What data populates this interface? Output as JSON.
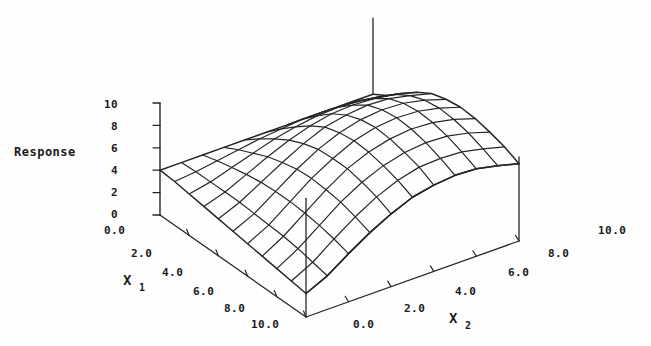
{
  "figure": {
    "kind": "3d-response-surface-wireframe",
    "background_color": "#fefefe",
    "line_color": "#262626",
    "text_color": "#1a1a1a"
  },
  "axes": {
    "z": {
      "title": "Response",
      "ticks": [
        "10",
        "8",
        "6",
        "4",
        "2",
        "0"
      ],
      "min": 0,
      "max": 10
    },
    "x1": {
      "name": "X",
      "subscript": "1",
      "ticks": [
        "0.0",
        "2.0",
        "4.0",
        "6.0",
        "8.0",
        "10.0"
      ],
      "min": 0,
      "max": 10,
      "arrow": "down-right"
    },
    "x2": {
      "name": "X",
      "subscript": "2",
      "ticks": [
        "0.0",
        "2.0",
        "4.0",
        "6.0",
        "8.0",
        "10.0"
      ],
      "min": 0,
      "max": 10,
      "arrow": "up-right"
    }
  },
  "chart_data": {
    "type": "surface",
    "title": "",
    "xlabel": "X1",
    "ylabel": "X2",
    "zlabel": "Response",
    "xlim": [
      0,
      10
    ],
    "ylim": [
      0,
      10
    ],
    "zlim": [
      0,
      10
    ],
    "grid": false,
    "legend": "none",
    "x1_values": [
      0,
      1,
      2,
      3,
      4,
      5,
      6,
      7,
      8,
      9,
      10
    ],
    "x2_values": [
      0,
      1,
      2,
      3,
      4,
      5,
      6,
      7,
      8,
      9,
      10
    ],
    "z_matrix": [
      [
        4.0,
        4.0,
        4.0,
        4.0,
        4.0,
        4.0,
        4.0,
        4.0,
        4.0,
        4.0,
        4.0
      ],
      [
        3.9,
        4.1,
        4.4,
        4.7,
        5.0,
        5.2,
        5.4,
        5.4,
        5.3,
        5.1,
        4.8
      ],
      [
        3.7,
        4.1,
        4.7,
        5.3,
        5.9,
        6.3,
        6.6,
        6.7,
        6.6,
        6.3,
        5.9
      ],
      [
        3.5,
        4.1,
        5.0,
        5.9,
        6.7,
        7.3,
        7.7,
        7.8,
        7.7,
        7.4,
        6.9
      ],
      [
        3.3,
        4.1,
        5.2,
        6.3,
        7.3,
        8.1,
        8.5,
        8.7,
        8.6,
        8.2,
        7.7
      ],
      [
        3.1,
        4.0,
        5.3,
        6.6,
        7.7,
        8.5,
        9.0,
        9.2,
        9.1,
        8.7,
        8.1
      ],
      [
        2.9,
        3.9,
        5.3,
        6.7,
        7.8,
        8.7,
        9.2,
        9.4,
        9.3,
        8.9,
        8.3
      ],
      [
        2.7,
        3.8,
        5.2,
        6.6,
        7.8,
        8.6,
        9.1,
        9.3,
        9.2,
        8.8,
        8.2
      ],
      [
        2.5,
        3.6,
        5.0,
        6.4,
        7.5,
        8.3,
        8.8,
        9.0,
        8.9,
        8.5,
        7.9
      ],
      [
        2.3,
        3.3,
        4.7,
        6.0,
        7.1,
        7.9,
        8.4,
        8.5,
        8.4,
        8.0,
        7.5
      ],
      [
        2.1,
        3.0,
        4.3,
        5.5,
        6.5,
        7.3,
        7.7,
        7.9,
        7.8,
        7.4,
        6.9
      ]
    ]
  }
}
